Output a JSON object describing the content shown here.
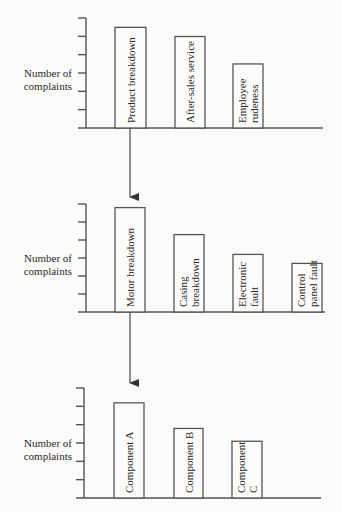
{
  "chart_data": [
    {
      "type": "bar",
      "title": "",
      "xlabel": "",
      "ylabel": "Number of complaints",
      "ylim": [
        0,
        6
      ],
      "grid": false,
      "categories": [
        "Product breakdown",
        "After-sales service",
        "Employee rudeness"
      ],
      "values": [
        5.5,
        5.0,
        3.5
      ],
      "label_lines": [
        [
          "Product breakdown"
        ],
        [
          "After-sales service"
        ],
        [
          "Employee",
          "rudeness"
        ]
      ]
    },
    {
      "type": "bar",
      "title": "",
      "xlabel": "",
      "ylabel": "Number of complaints",
      "ylim": [
        0,
        6
      ],
      "grid": false,
      "categories": [
        "Motor breakdown",
        "Casing breakdown",
        "Electronic fault",
        "Control panel fault"
      ],
      "values": [
        5.8,
        4.3,
        3.2,
        2.7
      ],
      "label_lines": [
        [
          "Motor breakdown"
        ],
        [
          "Casing",
          "breakdown"
        ],
        [
          "Electronic",
          "fault"
        ],
        [
          "Control",
          "panel fault"
        ]
      ]
    },
    {
      "type": "bar",
      "title": "",
      "xlabel": "",
      "ylabel": "Number of complaints",
      "ylim": [
        0,
        6
      ],
      "grid": false,
      "categories": [
        "Component A",
        "Component B",
        "Component C"
      ],
      "values": [
        5.2,
        3.8,
        3.1
      ],
      "label_lines": [
        [
          "Component A"
        ],
        [
          "Component B"
        ],
        [
          "Component",
          "C"
        ]
      ]
    }
  ],
  "ylabel_lines": [
    "Number of",
    "complaints"
  ],
  "connectors": [
    {
      "from": "Product breakdown",
      "to_chart": 2,
      "icon": "arrow-down-icon"
    },
    {
      "from": "Motor breakdown",
      "to_chart": 3,
      "icon": "arrow-down-icon"
    }
  ],
  "colors": {
    "line": "#555555",
    "text": "#2a2a2a",
    "background": "#fbfbf9"
  }
}
